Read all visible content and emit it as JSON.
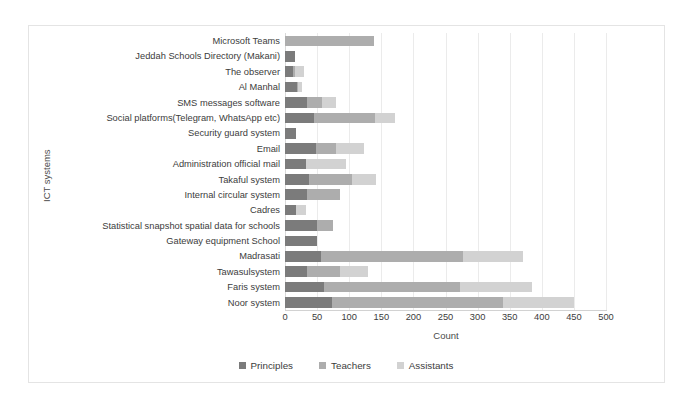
{
  "chart_data": {
    "type": "bar",
    "orientation": "horizontal",
    "stacked": true,
    "title": "",
    "xlabel": "Count",
    "ylabel": "ICT systems",
    "xlim": [
      0,
      500
    ],
    "xticks": [
      0,
      50,
      100,
      150,
      200,
      250,
      300,
      350,
      400,
      450,
      500
    ],
    "grid": true,
    "legend_position": "bottom",
    "legend": [
      "Principles",
      "Teachers",
      "Assistants"
    ],
    "colors": [
      "#7b7b7b",
      "#adadad",
      "#d2d2d2"
    ],
    "categories": [
      "Microsoft Teams",
      "Jeddah Schools Directory (Makani)",
      "The observer",
      "Al Manhal",
      "SMS messages software",
      "Social platforms(Telegram, WhatsApp etc)",
      "Security guard system",
      "Email",
      "Administration official mail",
      "Takaful system",
      "Internal circular system",
      "Cadres",
      "Statistical snapshot spatial data for schools",
      "Gateway equipment School",
      "Madrasati",
      "Tawasulsystem",
      "Faris system",
      "Noor system"
    ],
    "series": [
      {
        "name": "Principles",
        "values": [
          0,
          15,
          12,
          18,
          35,
          45,
          17,
          48,
          33,
          38,
          35,
          17,
          50,
          50,
          56,
          35,
          60,
          73
        ]
      },
      {
        "name": "Teachers",
        "values": [
          138,
          0,
          3,
          3,
          23,
          95,
          0,
          32,
          0,
          67,
          50,
          0,
          25,
          0,
          222,
          50,
          213,
          267
        ]
      },
      {
        "name": "Assistants",
        "values": [
          0,
          0,
          15,
          6,
          22,
          32,
          0,
          43,
          62,
          36,
          0,
          16,
          0,
          0,
          92,
          45,
          112,
          110
        ]
      }
    ]
  }
}
